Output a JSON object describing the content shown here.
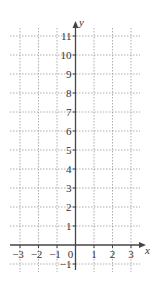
{
  "diagram": {
    "type": "coordinate-grid",
    "x_axis": {
      "label": "x",
      "min": -3,
      "max": 3,
      "ticks": [
        "-3",
        "-2",
        "-1",
        "0",
        "1",
        "2",
        "3"
      ]
    },
    "y_axis": {
      "label": "y",
      "min": -1,
      "max": 11,
      "ticks": [
        "-1",
        "1",
        "2",
        "3",
        "4",
        "5",
        "6",
        "7",
        "8",
        "9",
        "10",
        "11"
      ]
    },
    "grid": "dotted",
    "colors": {
      "axis": "#444444",
      "grid": "#9a9a9a",
      "text": "#333333"
    }
  }
}
